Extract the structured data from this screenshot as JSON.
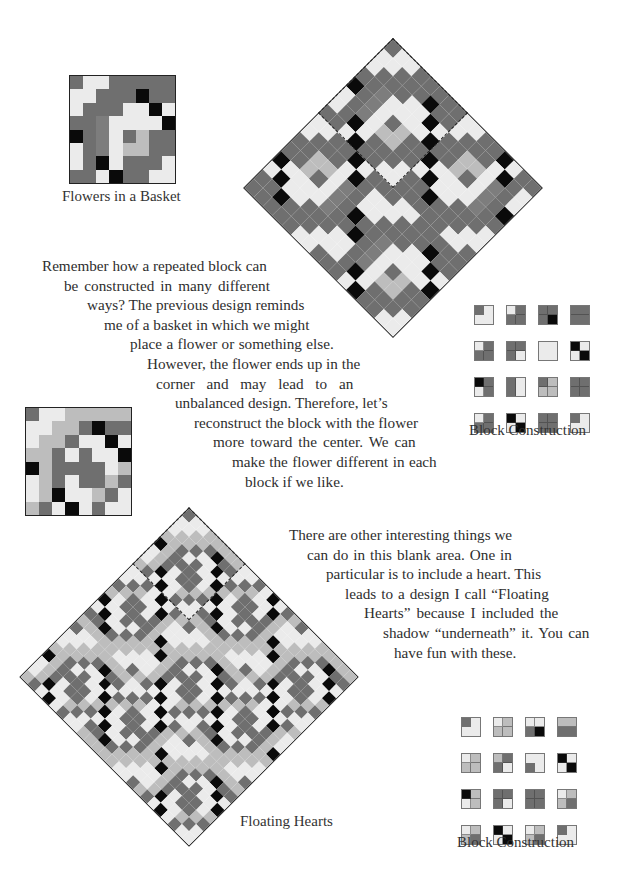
{
  "palette": {
    "D": "#6f6f6f",
    "M": "#7d7d7d",
    "L": "#ebebeb",
    "W": "#f7f7f7",
    "G": "#bdbdbd",
    "B": "#0a0a0a",
    "P": "#a9a9a9"
  },
  "blocks": {
    "basket": {
      "rows": [
        "DLLDDDDD",
        "LLDDDBDD",
        "LDDDLLBL",
        "DDMLLLLB",
        "BDMLDGDD",
        "LDMLGGDD",
        "LDBLDDDL",
        "DDLBDDLL"
      ]
    },
    "heart": {
      "rows": [
        "DLLGGGGG",
        "LLGGDBDD",
        "LGGDLLBL",
        "GGDLDLLB",
        "BGDDDDLG",
        "LGDLDDGD",
        "LGBLLGDL",
        "GDLBLDLL"
      ]
    }
  },
  "figures": {
    "basket_block": {
      "caption": "Flowers in a Basket"
    },
    "basket_quilt": {
      "block": "basket",
      "tiles": 2
    },
    "heart_block": {
      "caption": ""
    },
    "heart_quilt": {
      "block": "heart",
      "tiles": 3,
      "caption": "Floating Hearts"
    }
  },
  "construction_top": {
    "caption": "Block Construction",
    "tiles": [
      [
        "D",
        "L",
        "L",
        "L",
        "corner"
      ],
      [
        "L",
        "D",
        "D",
        "D",
        "quad"
      ],
      [
        "D",
        "D",
        "D",
        "B",
        "quad"
      ],
      [
        "D",
        "D",
        "D",
        "D",
        "hsplit"
      ],
      [
        "L",
        "D",
        "D",
        "D",
        "quad"
      ],
      [
        "D",
        "D",
        "D",
        "L",
        "quad"
      ],
      [
        "L",
        "L",
        "L",
        "L",
        "none"
      ],
      [
        "B",
        "L",
        "L",
        "B",
        "quad"
      ],
      [
        "B",
        "D",
        "L",
        "D",
        "quad"
      ],
      [
        "D",
        "L",
        "D",
        "L",
        "vsplit"
      ],
      [
        "D",
        "G",
        "G",
        "G",
        "quad"
      ],
      [
        "D",
        "D",
        "D",
        "D",
        "quad"
      ],
      [
        "L",
        "D",
        "D",
        "D",
        "quad"
      ],
      [
        "B",
        "L",
        "L",
        "B",
        "quad"
      ],
      [
        "D",
        "D",
        "D",
        "D",
        "quad"
      ],
      [
        "D",
        "L",
        "L",
        "L",
        "corner"
      ]
    ]
  },
  "construction_bottom": {
    "caption": "Block Construction",
    "tiles": [
      [
        "D",
        "L",
        "L",
        "L",
        "corner"
      ],
      [
        "L",
        "G",
        "G",
        "G",
        "quad"
      ],
      [
        "L",
        "L",
        "D",
        "B",
        "quad"
      ],
      [
        "G",
        "G",
        "D",
        "D",
        "hsplit"
      ],
      [
        "L",
        "G",
        "G",
        "G",
        "quad"
      ],
      [
        "G",
        "D",
        "D",
        "L",
        "quad"
      ],
      [
        "L",
        "L",
        "D",
        "L",
        "corner"
      ],
      [
        "B",
        "L",
        "L",
        "B",
        "quad"
      ],
      [
        "B",
        "G",
        "L",
        "G",
        "quad"
      ],
      [
        "D",
        "D",
        "D",
        "L",
        "quad"
      ],
      [
        "D",
        "D",
        "D",
        "D",
        "quad"
      ],
      [
        "L",
        "G",
        "G",
        "D",
        "quad"
      ],
      [
        "L",
        "G",
        "G",
        "D",
        "quad"
      ],
      [
        "B",
        "L",
        "L",
        "B",
        "quad"
      ],
      [
        "L",
        "G",
        "G",
        "D",
        "quad"
      ],
      [
        "D",
        "L",
        "L",
        "L",
        "corner"
      ]
    ]
  },
  "paragraph_1": {
    "lines": [
      {
        "text": "Remember how a repeated block can",
        "indent": 0
      },
      {
        "text": "be constructed in many different",
        "indent": 22,
        "spacing": 2.2
      },
      {
        "text": "ways? The previous design reminds",
        "indent": 45
      },
      {
        "text": "me of a basket in which we might",
        "indent": 62
      },
      {
        "text": "place a flower or something else.",
        "indent": 88,
        "spacing": 0.6
      },
      {
        "text": "However, the flower ends up in the",
        "indent": 105
      },
      {
        "text": "corner and may lead to an",
        "indent": 114,
        "spacing": 8
      },
      {
        "text": "unbalanced design. Therefore, let’s",
        "indent": 133
      },
      {
        "text": "reconstruct the block with the flower",
        "indent": 152
      },
      {
        "text": "more toward the center. We can",
        "indent": 171,
        "spacing": 2.2
      },
      {
        "text": "make the flower different in each",
        "indent": 190,
        "spacing": 0.6
      },
      {
        "text": "block if we like.",
        "indent": 203
      }
    ]
  },
  "paragraph_2": {
    "lines": [
      {
        "text": "There are other interesting things we",
        "indent": 0
      },
      {
        "text": "can do in this blank area. One in",
        "indent": 18,
        "spacing": 1.2
      },
      {
        "text": "particular is to include a heart. This",
        "indent": 37
      },
      {
        "text": "leads to a design I call “Floating",
        "indent": 56,
        "spacing": 1.2
      },
      {
        "text": "Hearts” because I included the",
        "indent": 75,
        "spacing": 2.2
      },
      {
        "text": "shadow “underneath” it. You can",
        "indent": 94,
        "spacing": 1.6
      },
      {
        "text": "have fun with these.",
        "indent": 105
      }
    ]
  }
}
